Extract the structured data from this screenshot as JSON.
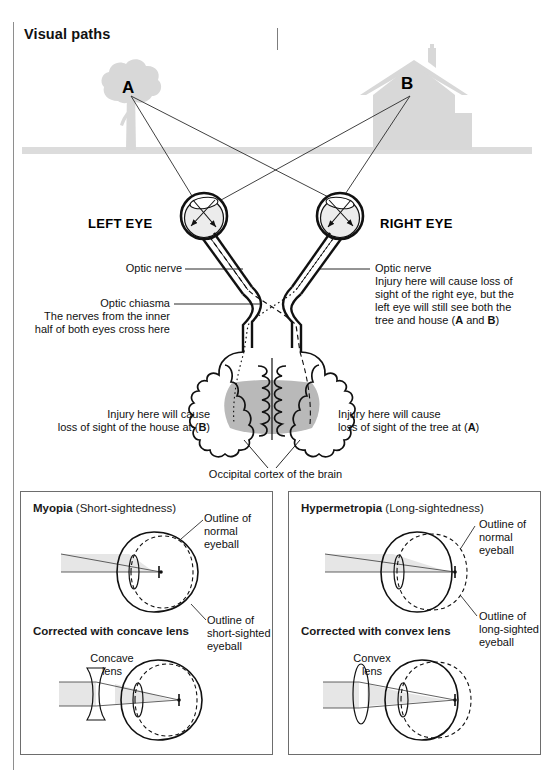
{
  "page": {
    "title": "Visual paths",
    "background": "#ffffff",
    "line_color": "#1a1a1a",
    "silhouette_color": "#d9d9d9",
    "cortex_shade_color": "#b3b3b3",
    "eye_fill_color": "#ececec",
    "beam_color": "#e2e2e2"
  },
  "scene": {
    "source_a_label": "A",
    "source_b_label": "B",
    "source_a_name": "tree",
    "source_b_name": "house",
    "left_eye_label": "LEFT EYE",
    "right_eye_label": "RIGHT EYE"
  },
  "annotations": {
    "optic_nerve_left": "Optic nerve",
    "optic_chiasma_title": "Optic chiasma",
    "optic_chiasma_desc_line1": "The nerves from the inner",
    "optic_chiasma_desc_line2": "half of both eyes cross here",
    "optic_nerve_right": "Optic nerve",
    "optic_nerve_right_desc_line1": "Injury here will cause loss of",
    "optic_nerve_right_desc_line2": "sight of the right eye, but the",
    "optic_nerve_right_desc_line3": "left eye will still see both the",
    "optic_nerve_right_desc_line4_pre": "tree and house (",
    "optic_nerve_right_desc_line4_a": "A",
    "optic_nerve_right_desc_line4_mid": " and ",
    "optic_nerve_right_desc_line4_b": "B",
    "optic_nerve_right_desc_line4_post": ")",
    "injury_left_line1": "Injury here will cause",
    "injury_left_line2_pre": "loss of sight of the house at (",
    "injury_left_line2_bold": "B",
    "injury_left_line2_post": ")",
    "injury_right_line1": "Injury here will cause",
    "injury_right_line2_pre": "loss of sight of the tree at (",
    "injury_right_line2_bold": "A",
    "injury_right_line2_post": ")",
    "occipital_cortex": "Occipital cortex of the brain"
  },
  "myopia": {
    "title_bold": "Myopia",
    "title_rest": " (Short-sightedness)",
    "outline_normal_line1": "Outline of",
    "outline_normal_line2": "normal",
    "outline_normal_line3": "eyeball",
    "outline_condition_line1": "Outline of",
    "outline_condition_line2": "short-sighted",
    "outline_condition_line3": "eyeball",
    "corrected_title": "Corrected with concave lens",
    "lens_label_line1": "Concave",
    "lens_label_line2": "lens"
  },
  "hypermetropia": {
    "title_bold": "Hypermetropia",
    "title_rest": " (Long-sightedness)",
    "outline_normal_line1": "Outline of",
    "outline_normal_line2": "normal",
    "outline_normal_line3": "eyeball",
    "outline_condition_line1": "Outline of",
    "outline_condition_line2": "long-sighted",
    "outline_condition_line3": "eyeball",
    "corrected_title": "Corrected with convex lens",
    "lens_label_line1": "Convex",
    "lens_label_line2": "lens"
  }
}
